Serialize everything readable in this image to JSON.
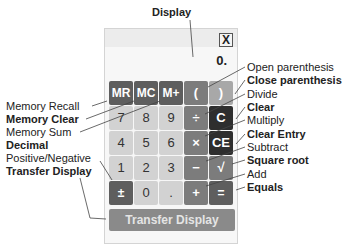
{
  "title_label": "Display",
  "calculator": {
    "close_label": "X",
    "display_value": "0.",
    "buttons": {
      "mr": "MR",
      "mc": "MC",
      "mplus": "M+",
      "open_paren": "(",
      "close_paren": ")",
      "seven": "7",
      "eight": "8",
      "nine": "9",
      "divide": "÷",
      "clear": "C",
      "four": "4",
      "five": "5",
      "six": "6",
      "multiply": "×",
      "clear_entry": "CE",
      "one": "1",
      "two": "2",
      "three": "3",
      "subtract": "−",
      "sqrt": "√",
      "plus_minus": "±",
      "zero": "0",
      "decimal": ".",
      "add": "+",
      "equals": "="
    },
    "transfer_label": "Transfer Display"
  },
  "left_labels": [
    {
      "text": "Memory Recall",
      "bold": false
    },
    {
      "text": "Memory Clear",
      "bold": true
    },
    {
      "text": "Memory Sum",
      "bold": false
    },
    {
      "text": "Decimal",
      "bold": true
    },
    {
      "text": "Positive/Negative",
      "bold": false
    },
    {
      "text": "Transfer Display",
      "bold": true
    }
  ],
  "right_labels": [
    {
      "text": "Open parenthesis",
      "bold": false
    },
    {
      "text": "Close parenthesis",
      "bold": true
    },
    {
      "text": "Divide",
      "bold": false
    },
    {
      "text": "Clear",
      "bold": true
    },
    {
      "text": "Multiply",
      "bold": false
    },
    {
      "text": "Clear Entry",
      "bold": true
    },
    {
      "text": "Subtract",
      "bold": false
    },
    {
      "text": "Square root",
      "bold": true
    },
    {
      "text": "Add",
      "bold": false
    },
    {
      "text": "Equals",
      "bold": true
    }
  ]
}
